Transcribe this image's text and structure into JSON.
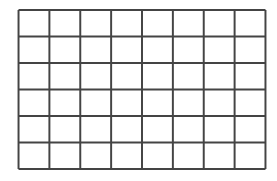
{
  "grid": {
    "columns": 8,
    "rows": 6,
    "line_color": "#444444",
    "background": "#ffffff",
    "line_width": 2,
    "x_lines": [
      0,
      31.25,
      62.5,
      93.75,
      125,
      156.25,
      187.5,
      218.75,
      250
    ],
    "y_lines": [
      0,
      26.83,
      53.67,
      80.5,
      107.33,
      134.17,
      161
    ]
  }
}
